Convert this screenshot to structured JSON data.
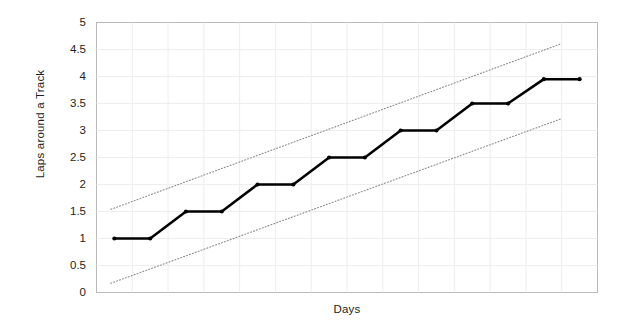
{
  "chart_data": {
    "type": "line",
    "title": "",
    "xlabel": "Days",
    "ylabel": "Laps around a Track",
    "ylim": [
      0,
      5
    ],
    "xlim": [
      0,
      14
    ],
    "grid": true,
    "legend": "none",
    "y_ticks": [
      "5",
      "4.5",
      "4",
      "3.5",
      "3",
      "2.5",
      "2",
      "1.5",
      "1",
      "0.5",
      "0"
    ],
    "y_tick_values": [
      5,
      4.5,
      4,
      3.5,
      3,
      2.5,
      2,
      1.5,
      1,
      0.5,
      0
    ],
    "x_ticks": [],
    "series": [
      {
        "name": "Laps around a Track",
        "style": "solid-thick-with-markers",
        "color": "#000000",
        "x": [
          0.5,
          1.5,
          2.5,
          3.5,
          4.5,
          5.5,
          6.5,
          7.5,
          8.5,
          9.5,
          10.5,
          11.5,
          12.5,
          13.5
        ],
        "values": [
          1.0,
          1.0,
          1.5,
          1.5,
          2.0,
          2.0,
          2.5,
          2.5,
          3.0,
          3.0,
          3.5,
          3.5,
          3.95,
          3.95
        ]
      },
      {
        "name": "Upper control limit",
        "style": "dotted",
        "color": "#8a8a8a",
        "x": [
          0.4,
          13.0
        ],
        "values": [
          1.54,
          4.61
        ]
      },
      {
        "name": "Lower control limit",
        "style": "dotted",
        "color": "#8a8a8a",
        "x": [
          0.4,
          13.0
        ],
        "values": [
          0.17,
          3.22
        ]
      }
    ],
    "annotations": []
  },
  "axes": {
    "y_title": "Laps around a Track",
    "x_title": "Days"
  }
}
